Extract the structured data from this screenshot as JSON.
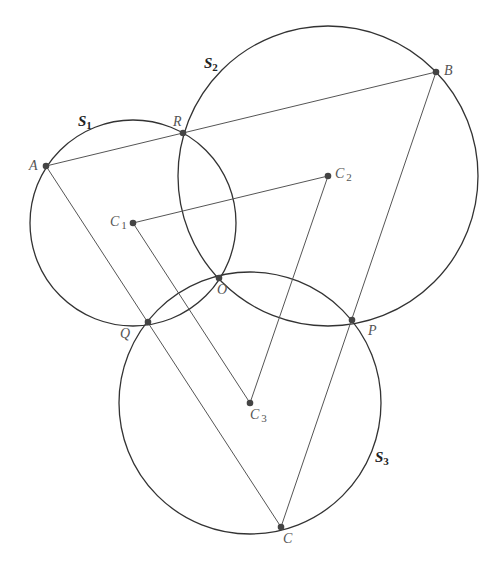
{
  "diagram": {
    "type": "geometry",
    "circles": [
      {
        "id": "S1",
        "label": "S",
        "sub": "1",
        "center": "C1",
        "cx": 133,
        "cy": 223,
        "r": 103,
        "label_x": 78,
        "label_y": 126
      },
      {
        "id": "S2",
        "label": "S",
        "sub": "2",
        "center": "C2",
        "cx": 328,
        "cy": 176,
        "r": 150,
        "label_x": 204,
        "label_y": 68
      },
      {
        "id": "S3",
        "label": "S",
        "sub": "3",
        "center": "C3",
        "cx": 250,
        "cy": 403,
        "r": 131,
        "label_x": 375,
        "label_y": 462
      }
    ],
    "points": [
      {
        "id": "A",
        "label": "A",
        "sub": "",
        "x": 46,
        "y": 166,
        "label_x": 29,
        "label_y": 170
      },
      {
        "id": "R",
        "label": "R",
        "sub": "",
        "x": 183,
        "y": 133,
        "label_x": 173,
        "label_y": 126
      },
      {
        "id": "B",
        "label": "B",
        "sub": "",
        "x": 436,
        "y": 72,
        "label_x": 444,
        "label_y": 75
      },
      {
        "id": "C1",
        "label": "C",
        "sub": "1",
        "x": 133,
        "y": 223,
        "label_x": 110,
        "label_y": 226
      },
      {
        "id": "C2",
        "label": "C",
        "sub": "2",
        "x": 328,
        "y": 176,
        "label_x": 335,
        "label_y": 178
      },
      {
        "id": "C3",
        "label": "C",
        "sub": "3",
        "x": 250,
        "y": 403,
        "label_x": 250,
        "label_y": 419
      },
      {
        "id": "O",
        "label": "O",
        "sub": "",
        "x": 219,
        "y": 278,
        "label_x": 217,
        "label_y": 294
      },
      {
        "id": "Q",
        "label": "Q",
        "sub": "",
        "x": 148,
        "y": 322,
        "label_x": 120,
        "label_y": 338
      },
      {
        "id": "P",
        "label": "P",
        "sub": "",
        "x": 352,
        "y": 320,
        "label_x": 368,
        "label_y": 335
      },
      {
        "id": "C",
        "label": "C",
        "sub": "",
        "x": 281,
        "y": 527,
        "label_x": 283,
        "label_y": 543
      }
    ],
    "segments": [
      {
        "from": "A",
        "to": "B"
      },
      {
        "from": "A",
        "to": "C"
      },
      {
        "from": "B",
        "to": "C"
      },
      {
        "from": "C1",
        "to": "C2"
      },
      {
        "from": "C1",
        "to": "C3"
      },
      {
        "from": "C2",
        "to": "C3"
      }
    ]
  }
}
